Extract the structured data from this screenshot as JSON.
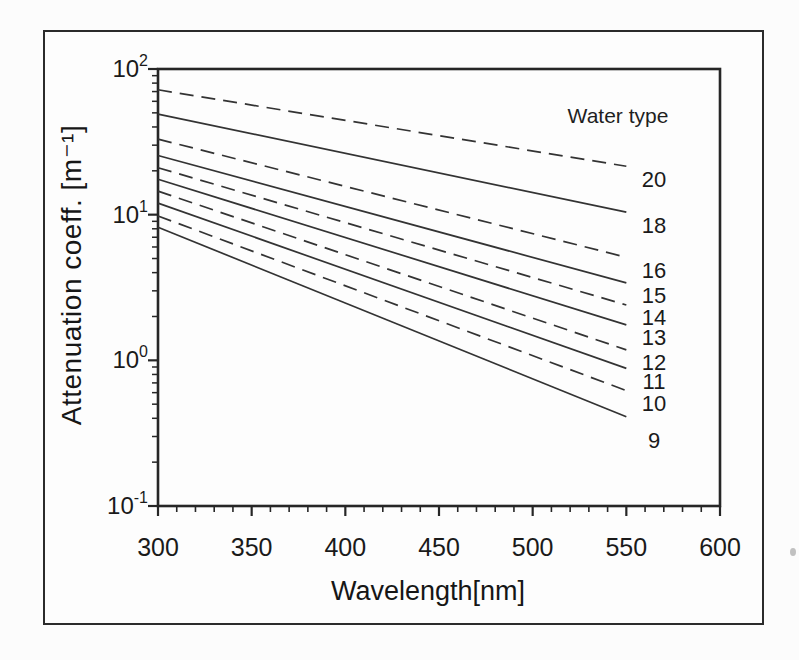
{
  "chart_data": {
    "type": "line",
    "title": "",
    "xlabel": "Wavelength[nm]",
    "ylabel": "Attenuation coeff. [m⁻¹]",
    "legend_title": "Water type",
    "x_range": [
      300,
      600
    ],
    "x_ticks": [
      300,
      350,
      400,
      450,
      500,
      550,
      600
    ],
    "x_minor_step": 10,
    "y_scale": "log",
    "y_range": [
      0.1,
      100
    ],
    "y_ticks": [
      100,
      10,
      1,
      0.1
    ],
    "y_tick_labels": [
      "10^2",
      "10^1",
      "10^0",
      "10^-1"
    ],
    "grid": "off",
    "legend_position": "right-of-line-ends",
    "line_x_span": [
      300,
      550
    ],
    "series": [
      {
        "label": "20",
        "style": "dashed",
        "x": [
          300,
          550
        ],
        "values": [
          72,
          21.5
        ]
      },
      {
        "label": "18",
        "style": "solid",
        "x": [
          300,
          550
        ],
        "values": [
          49,
          10.4
        ]
      },
      {
        "label": "16",
        "style": "dashed",
        "x": [
          300,
          550
        ],
        "values": [
          33,
          5.1
        ]
      },
      {
        "label": "15",
        "style": "solid",
        "x": [
          300,
          550
        ],
        "values": [
          25.5,
          3.4
        ]
      },
      {
        "label": "14",
        "style": "dashed",
        "x": [
          300,
          550
        ],
        "values": [
          21,
          2.4
        ]
      },
      {
        "label": "13",
        "style": "solid",
        "x": [
          300,
          550
        ],
        "values": [
          17.5,
          1.75
        ]
      },
      {
        "label": "12",
        "style": "dashed",
        "x": [
          300,
          550
        ],
        "values": [
          14.5,
          1.18
        ]
      },
      {
        "label": "11",
        "style": "solid",
        "x": [
          300,
          550
        ],
        "values": [
          12,
          0.88
        ]
      },
      {
        "label": "10",
        "style": "dashed",
        "x": [
          300,
          550
        ],
        "values": [
          9.8,
          0.62
        ]
      },
      {
        "label": "9",
        "style": "solid",
        "x": [
          300,
          550
        ],
        "values": [
          8.2,
          0.41
        ]
      }
    ]
  }
}
